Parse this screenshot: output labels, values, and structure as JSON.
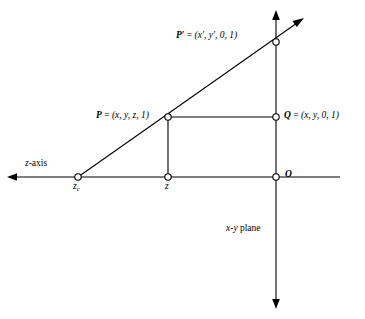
{
  "figure": {
    "background_color": "#ffffff",
    "line_color": "#000000",
    "marker_fill": "#ffffff",
    "labels": {
      "p_prime": "P′ = (x′, y′, 0, 1)",
      "p_prime_name": "P′",
      "p_prime_coords": "(x′, y′, 0, 1)",
      "p": "P = (x, y, z, 1)",
      "p_name": "P",
      "p_coords": "(x, y, z, 1)",
      "q": "Q = (x, y, 0, 1)",
      "q_name": "Q",
      "q_coords": "(x, y, 0, 1)",
      "origin": "O",
      "z_axis": "z-axis",
      "z_axis_letter": "z",
      "z_axis_suffix": "-axis",
      "z_c": "z_c",
      "z_c_letter": "z",
      "z_c_sub": "c",
      "z": "z",
      "xy_plane": "x-y plane",
      "xy_plane_x": "x",
      "xy_plane_dash": "-",
      "xy_plane_y": "y",
      "xy_plane_suffix": " plane"
    },
    "points": [
      {
        "name": "z_c",
        "x": 78,
        "y": 177,
        "marker": "open-circle"
      },
      {
        "name": "z",
        "x": 168,
        "y": 177,
        "marker": "open-circle"
      },
      {
        "name": "O",
        "x": 276,
        "y": 177,
        "marker": "open-circle"
      },
      {
        "name": "P",
        "x": 168,
        "y": 117,
        "marker": "open-circle"
      },
      {
        "name": "Q",
        "x": 276,
        "y": 117,
        "marker": "open-circle"
      },
      {
        "name": "P_prime",
        "x": 276,
        "y": 42,
        "marker": "open-circle"
      }
    ],
    "axes": {
      "z_axis": {
        "from_x": 8,
        "from_y": 177,
        "to_x": 340,
        "to_y": 177,
        "arrow": "left"
      },
      "vertical_axis": {
        "from_x": 276,
        "from_y": 12,
        "to_x": 276,
        "to_y": 308,
        "arrow": "both"
      }
    },
    "ray": {
      "from_x": 78,
      "from_y": 177,
      "to_x": 303,
      "to_y": 19,
      "arrow": "end"
    }
  }
}
